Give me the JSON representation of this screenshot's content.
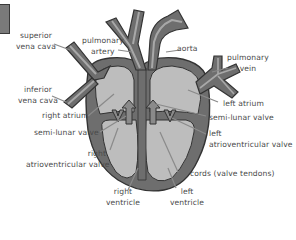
{
  "diagram": {
    "colors": {
      "outline": "#3a3a3a",
      "wall": "#6e6e6e",
      "chamber": "#bdbdbd",
      "vessel_stripe": "#a8a8a8",
      "label_text": "#4a4a4a",
      "pointer_line": "#8a8a8a"
    },
    "labels": {
      "superior_vena_cava": [
        "superior",
        "vena cava"
      ],
      "pulmonary_artery": [
        "pulmonary",
        "artery"
      ],
      "aorta": [
        "aorta"
      ],
      "pulmonary_vein": [
        "pulmonary",
        "vein"
      ],
      "inferior_vena_cava": [
        "inferior",
        "vena cava"
      ],
      "left_atrium": [
        "left atrium"
      ],
      "right_atrium": [
        "right atrium"
      ],
      "semi_lunar_valve_left": [
        "semi-lunar valve"
      ],
      "semi_lunar_valve_right": [
        "semi-lunar valve"
      ],
      "left_atrioventricular_valve": [
        "left",
        "atrioventricular valve"
      ],
      "right_atrioventricular_valve": [
        "right",
        "atrioventricular valve"
      ],
      "cords": [
        "cords (valve tendons)"
      ],
      "right_ventricle": [
        "right",
        "ventricle"
      ],
      "left_ventricle": [
        "left",
        "ventricle"
      ]
    }
  }
}
